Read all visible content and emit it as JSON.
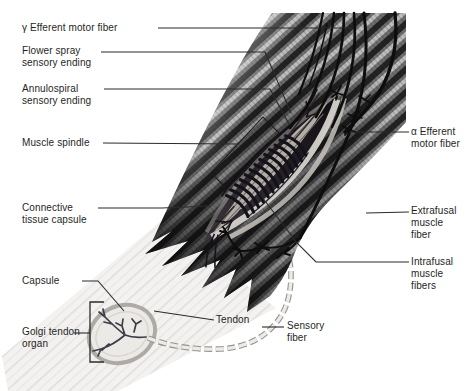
{
  "labels": {
    "gamma_efferent_motor_fiber": "γ Efferent motor fiber",
    "flower_spray_sensory_ending": "Flower spray\nsensory ending",
    "annulospiral_sensory_ending": "Annulospiral\nsensory ending",
    "muscle_spindle": "Muscle spindle",
    "connective_tissue_capsule": "Connective\ntissue capsule",
    "capsule": "Capsule",
    "golgi_tendon_organ": "Golgi tendon\norgan",
    "tendon": "Tendon",
    "sensory_fiber": "Sensory\nfiber",
    "alpha_efferent_motor_fiber": "α Efferent\nmotor fiber",
    "extrafusal_muscle_fiber": "Extrafusal\nmuscle\nfiber",
    "intrafusal_muscle_fibers": "Intrafusal\nmuscle\nfibers"
  },
  "colors": {
    "background": "#ffffff",
    "ink": "#1f1f1f",
    "muscle_dark": "#242424",
    "muscle_mid": "#6f6f6f",
    "muscle_highlight": "#bfbfbf",
    "tendon_light": "#f2f1ef",
    "nerve": "#0d0d0d"
  }
}
